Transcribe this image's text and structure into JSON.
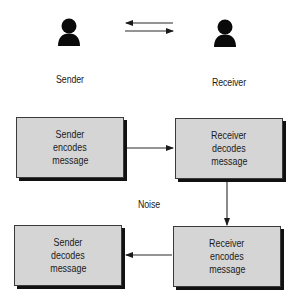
{
  "top": {
    "sender_label": "Sender",
    "receiver_label": "Receiver",
    "sender_icon": "person-icon",
    "receiver_icon": "person-icon",
    "exchange_arrows": [
      "arrow-left",
      "arrow-right"
    ]
  },
  "flow": {
    "boxes": [
      {
        "lines": [
          "Sender",
          "encodes",
          "message"
        ]
      },
      {
        "lines": [
          "Receiver",
          "decodes",
          "message"
        ]
      },
      {
        "lines": [
          "Sender",
          "decodes",
          "message"
        ]
      },
      {
        "lines": [
          "Receiver",
          "encodes",
          "message"
        ]
      }
    ],
    "noise_label": "Noise"
  },
  "colors": {
    "box_fill": "#d5d5d5",
    "shadow": "#111111",
    "line": "#2a2a2a"
  }
}
